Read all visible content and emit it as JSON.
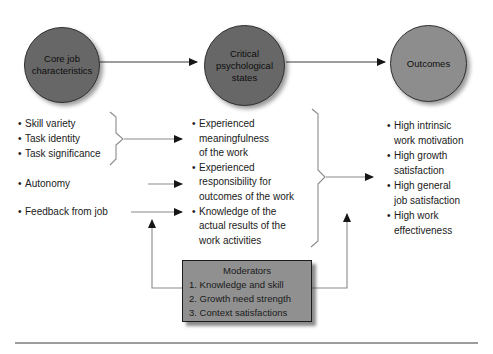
{
  "ui": {
    "bullet": "•"
  },
  "nodes": {
    "core": {
      "label": "Core job\ncharacteristics"
    },
    "psychological": {
      "label": "Critical\npsychological\nstates"
    },
    "outcomes": {
      "label": "Outcomes"
    }
  },
  "characteristics": {
    "grouped": [
      "Skill variety",
      "Task identity",
      "Task significance"
    ],
    "autonomy": "Autonomy",
    "feedback": "Feedback from job"
  },
  "psych_states": [
    "Experienced\nmeaningfulness\nof the work",
    "Experienced\nresponsibility for\noutcomes of the work",
    "Knowledge of the\nactual results of the\nwork activities"
  ],
  "outcome_items": [
    "High intrinsic\nwork motivation",
    "High growth\nsatisfaction",
    "High general\njob satisfaction",
    "High work\neffectiveness"
  ],
  "moderators": {
    "title": "Moderators",
    "items": [
      "1. Knowledge and skill",
      "2. Growth need strength",
      "3. Context satisfactions"
    ]
  },
  "colors": {
    "circle_dark": "#676767",
    "circle_light": "#8d8d8d",
    "box_fill": "#909090",
    "line": "#8a8a8a",
    "dark_line": "#3c3c3c",
    "arrowhead": "#161616",
    "text": "#1a1a1a",
    "background": "#ffffff"
  }
}
